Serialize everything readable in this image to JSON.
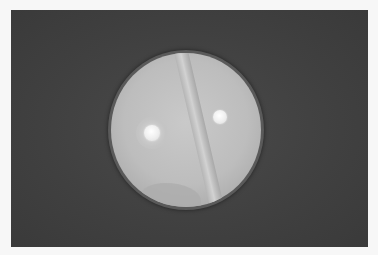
{
  "image": {
    "subject": "petri-dish",
    "colors": {
      "page_background": "#f7f7f7",
      "photo_background": "#404040",
      "agar": "#c0c0c0",
      "disc": "#f5f5f5"
    },
    "elements": [
      {
        "name": "central-streak",
        "description": "diagonal culture streak across dish"
      },
      {
        "name": "left-disc",
        "description": "antibiotic disc with inhibition halo"
      },
      {
        "name": "right-disc",
        "description": "antibiotic disc without halo"
      }
    ]
  }
}
